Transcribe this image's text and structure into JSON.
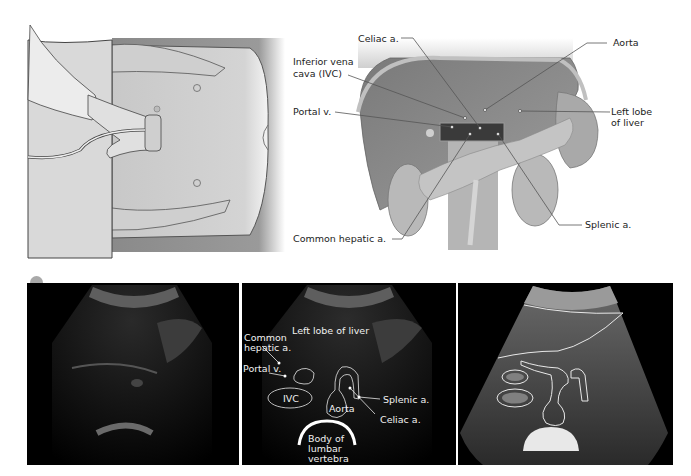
{
  "figure": {
    "top_left": {
      "title": "Patient supine with transducer on upper abdomen",
      "description": "Illustration of clinician holding ultrasound probe transversely on epigastrium of supine patient"
    },
    "top_right": {
      "labels": {
        "celiac": "Celiac a.",
        "ivc_line1": "Inferior vena",
        "ivc_line2": "cava (IVC)",
        "portal": "Portal v.",
        "aorta": "Aorta",
        "left_lobe_line1": "Left lobe",
        "left_lobe_line2": "of liver",
        "common_hepatic": "Common hepatic a.",
        "splenic": "Splenic a."
      }
    },
    "panel_marker_color": "#a9a9a9",
    "bottom_middle": {
      "labels": {
        "left_lobe": "Left lobe of liver",
        "common_hepatic_line1": "Common",
        "common_hepatic_line2": "hepatic a.",
        "portal": "Portal v.",
        "ivc": "IVC",
        "aorta": "Aorta",
        "splenic": "Splenic a.",
        "celiac": "Celiac a.",
        "vertebra_line1": "Body of",
        "vertebra_line2": "lumbar",
        "vertebra_line3": "vertebra"
      }
    }
  }
}
